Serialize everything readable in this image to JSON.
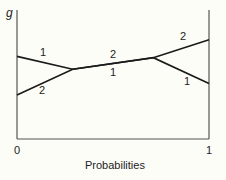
{
  "chart_data": {
    "type": "line",
    "title": "",
    "xlabel": "Probabilities",
    "ylabel": "g",
    "xlim": [
      0,
      1
    ],
    "ylim": [
      0,
      1
    ],
    "xticks": [
      "0",
      "1"
    ],
    "grid": false,
    "legend": "none (inline numeric series labels)",
    "series": [
      {
        "name": "1",
        "x": [
          0,
          0.29,
          0.71,
          1
        ],
        "y": [
          0.64,
          0.54,
          0.63,
          0.43
        ]
      },
      {
        "name": "2",
        "x": [
          0,
          0.29,
          0.71,
          1
        ],
        "y": [
          0.34,
          0.54,
          0.63,
          0.77
        ]
      }
    ],
    "annotations": [
      {
        "text": "1",
        "near": "series 1, left segment (above)"
      },
      {
        "text": "2",
        "near": "series 2, left segment (below)"
      },
      {
        "text": "2",
        "near": "shared middle segment (above)"
      },
      {
        "text": "1",
        "near": "shared middle segment (below)"
      },
      {
        "text": "2",
        "near": "series 2, right segment (above)"
      },
      {
        "text": "1",
        "near": "series 1, right segment (below)"
      }
    ]
  },
  "labels": {
    "y_axis": "g",
    "x_axis": "Probabilities",
    "x_tick_min": "0",
    "x_tick_max": "1",
    "series_1": "1",
    "series_2": "2"
  },
  "colors": {
    "line": "#1a1a1a",
    "axis": "#555555",
    "background": "#fdfdf8"
  }
}
